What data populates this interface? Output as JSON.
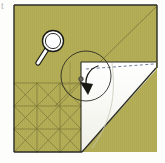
{
  "figure": {
    "title": "Origami fold step diagram",
    "caption": "Square sheet with precrease grid, corner flap folded out revealing white reverse side",
    "background_color": "#fdfdfb",
    "width": 165,
    "height": 163
  },
  "colors": {
    "paper_front": "#b4ae57",
    "paper_front_shade": "#aaa44f",
    "paper_back": "#fbfbf6",
    "paper_back_shade": "#f2f2ea",
    "outline": "#2b2b24",
    "crease_line": "#7a7538",
    "crease_line_light": "#8d8744",
    "dashed_fold": "#6d7d9a",
    "detail_circle": "#2b2b24",
    "arrow": "#1a1a14",
    "magnifier_fill": "#ffffff",
    "magnifier_stroke": "#1a1a14",
    "artifact": "#7c7c7c"
  },
  "sheet": {
    "label": "Square paper sheet",
    "left": 14,
    "top": 5,
    "right": 157,
    "bottom": 152
  },
  "elements": {
    "paper_front_label": "Coloured side of paper",
    "paper_back_label": "White reverse side of paper",
    "folded_flap_label": "Folded corner flap",
    "crease_grid_label": "Precrease grid",
    "main_diagonal_label": "Main diagonal crease",
    "dashed_fold_label": "Valley fold reference line",
    "detail_circle_label": "Detail magnification circle",
    "rotation_arrow_label": "Fold direction arrow",
    "magnifier_label": "Magnifier symbol",
    "corner_artifact_label": "Scan artifact mark"
  },
  "geometry": {
    "sheet_outline": "14,5 157,5 157,152 14,152",
    "main_diagonal": "55,106 156,7",
    "flap_white_region": "81,62 156,62 156,70 80,152 81,62",
    "flap_hypotenuse": "156,70 82,152",
    "flap_vertical_edge": "81,62 81,152",
    "flap_top_edge": "81,62 156,62",
    "flap_inner_curve": "112,66 114,110 90,146",
    "dashed_line": "86,68 154,63",
    "detail_circle_center_x": 86,
    "detail_circle_center_y": 76,
    "detail_circle_radius": 25,
    "detail_dot_x": 81,
    "detail_dot_y": 79,
    "arrow_path": "M 96 65 A 16 16 0 0 0 84 87",
    "arrow_head": "84,92 79,81 91,83",
    "magnifier_lens_cx": 52,
    "magnifier_lens_cy": 41,
    "magnifier_lens_r": 9,
    "magnifier_handle": "46,48 38,62",
    "grid_cell": 23,
    "grid_origin_x": 14,
    "grid_origin_y": 83,
    "grid_cols": 3,
    "grid_rows": 3
  },
  "crease_lines": {
    "verticals": [
      "37,83 37,152",
      "60,83 60,152",
      "81,62 81,152"
    ],
    "horizontals": [
      "14,83 81,83",
      "14,106 81,106",
      "14,129 81,129"
    ],
    "diagonals_down": [
      "14,83 81,152",
      "14,106 60,152",
      "14,129 37,152",
      "37,83 81,129",
      "60,83 81,106"
    ],
    "diagonals_up": [
      "14,152 81,83",
      "14,129 60,83",
      "14,106 37,83",
      "37,152 81,106",
      "60,152 81,129"
    ],
    "extra": [
      "55,106 100,62",
      "81,62 112,90",
      "100,62 81,83"
    ]
  },
  "corner_artifact": {
    "text": "t",
    "x": 2,
    "y": 6
  }
}
